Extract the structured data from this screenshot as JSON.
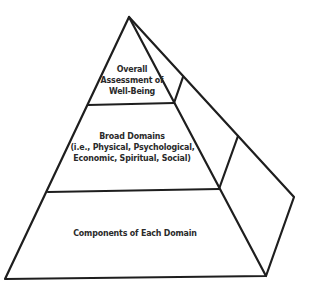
{
  "diagram": {
    "type": "pyramid",
    "tiers": [
      {
        "level": "top",
        "lines": [
          "Overall",
          "Assessment of",
          "Well-Being"
        ]
      },
      {
        "level": "middle",
        "lines": [
          "Broad Domains",
          "(i.e., Physical, Psychological,",
          "Economic, Spiritual, Social)"
        ]
      },
      {
        "level": "bottom",
        "lines": [
          "Components of Each Domain"
        ]
      }
    ],
    "line_color": "#1e1e1e",
    "text_color": "#2a2a2a",
    "background": "#ffffff"
  }
}
